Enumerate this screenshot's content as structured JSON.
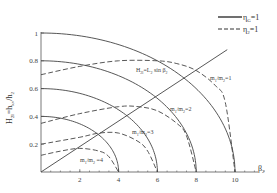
{
  "chart_data": {
    "type": "line",
    "title": "",
    "xlabel": "β2",
    "ylabel": "H2l=hkv/h2",
    "xlim": [
      0,
      11.5
    ],
    "ylim": [
      0,
      1
    ],
    "xticks": [
      2,
      4,
      6,
      8,
      10
    ],
    "yticks": [
      0.2,
      0.4,
      0.6,
      0.8,
      1
    ],
    "xtick_labels": [
      "2",
      "4",
      "6",
      "8",
      "10"
    ],
    "ytick_labels": [
      "0.2",
      "0.4",
      "0.6",
      "0.8",
      "1"
    ],
    "grid": false,
    "legend_position": "top-right",
    "legend": [
      {
        "label": "ηG=1",
        "style": "solid"
      },
      {
        "label": "η2=1",
        "style": "dashed"
      }
    ],
    "series": [
      {
        "name": "ηG=1 (r=4)",
        "style": "solid",
        "x": [
          0,
          1,
          2,
          3,
          3.5,
          4
        ],
        "y": [
          0.4,
          0.387,
          0.346,
          0.265,
          0.194,
          0
        ]
      },
      {
        "name": "ηG=1 (r=6)",
        "style": "solid",
        "x": [
          0,
          2,
          3,
          4,
          5,
          5.5,
          6
        ],
        "y": [
          0.6,
          0.566,
          0.52,
          0.447,
          0.332,
          0.24,
          0
        ]
      },
      {
        "name": "ηG=1 (r=8)",
        "style": "solid",
        "x": [
          0,
          2,
          4,
          5,
          6,
          7,
          7.5,
          8
        ],
        "y": [
          0.8,
          0.775,
          0.693,
          0.624,
          0.529,
          0.387,
          0.278,
          0
        ]
      },
      {
        "name": "ηG=1 (r=10)",
        "style": "solid",
        "x": [
          7,
          8,
          9,
          9.5,
          10
        ],
        "y": [
          0.714,
          0.6,
          0.436,
          0.312,
          0
        ]
      },
      {
        "name": "m1/m2=1",
        "style": "dashed",
        "x": [
          0,
          2,
          4,
          6,
          7,
          8,
          9,
          9.5,
          10
        ],
        "y": [
          0.7,
          0.76,
          0.8,
          0.8,
          0.78,
          0.73,
          0.62,
          0.5,
          0
        ]
      },
      {
        "name": "m1/m2=2",
        "style": "dashed",
        "x": [
          0,
          2,
          4,
          5,
          6,
          7,
          7.5,
          8
        ],
        "y": [
          0.35,
          0.42,
          0.47,
          0.47,
          0.44,
          0.35,
          0.26,
          0
        ]
      },
      {
        "name": "m1/m2=3",
        "style": "dashed",
        "x": [
          0,
          2,
          3,
          4,
          5,
          5.5,
          6
        ],
        "y": [
          0.2,
          0.25,
          0.28,
          0.28,
          0.22,
          0.15,
          0
        ]
      },
      {
        "name": "m1/m2=4",
        "style": "dashed",
        "x": [
          0,
          1,
          2,
          3,
          3.5,
          4
        ],
        "y": [
          0.12,
          0.15,
          0.17,
          0.15,
          0.11,
          0
        ]
      },
      {
        "name": "H2l=L2 sin β2",
        "style": "solid",
        "x": [
          0,
          9.6
        ],
        "y": [
          0,
          0.88
        ]
      }
    ],
    "annotations": [
      {
        "text": "H2l=L2 sin β2",
        "x": 4.8,
        "y": 0.6
      },
      {
        "text": "m1/m2=1",
        "x": 8.6,
        "y": 0.58
      },
      {
        "text": "m1/m2=2",
        "x": 5.2,
        "y": 0.4
      },
      {
        "text": "m1/m2=3",
        "x": 4.4,
        "y": 0.26
      },
      {
        "text": "m1/m2=4",
        "x": 2.0,
        "y": 0.05
      }
    ]
  },
  "labels": {
    "xlabel": "β",
    "xlabel_sub": "2",
    "ylabel": "H2l=hkv/h2",
    "legend_solid": "η",
    "legend_solid_sub": "G",
    "legend_solid_eq": "=1",
    "legend_dashed": "η",
    "legend_dashed_sub": "2",
    "legend_dashed_eq": "=1",
    "line_label": "H",
    "line_label_sub": "2l",
    "line_label_rest": "=L",
    "line_label_sub2": "2",
    "line_label_rest2": " sin β",
    "line_label_sub3": "2",
    "m1": "m",
    "m1_sub": "1",
    "m2_mid": "/m",
    "m2_sub": "2",
    "m_eq1": "=1",
    "m_eq2": "=2",
    "m_eq3": "=3",
    "m_eq4": " =4",
    "ylabel_H": "H",
    "ylabel_H_sub": "2l",
    "ylabel_mid": "=h",
    "ylabel_kv": "kv",
    "ylabel_slash": "/h",
    "ylabel_h2": "2"
  }
}
